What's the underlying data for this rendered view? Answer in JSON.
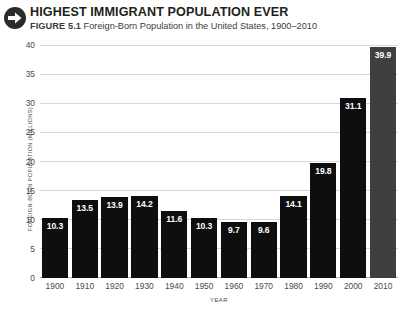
{
  "header": {
    "icon": "arrow-right-circle-icon",
    "title": "HIGHEST IMMIGRANT POPULATION EVER",
    "figure_number": "FIGURE 5.1",
    "figure_caption": "Foreign-Born Population in the United States, 1900–2010"
  },
  "colors": {
    "bar": "#0e0e0e",
    "bar_highlight": "#3f3f3f",
    "gridline": "#d8d8d8",
    "text": "#231f20",
    "axis_text": "#4a4a4a",
    "background": "#ffffff"
  },
  "chart_data": {
    "type": "bar",
    "title": "HIGHEST IMMIGRANT POPULATION EVER",
    "subtitle": "Foreign-Born Population in the United States, 1900–2010",
    "xlabel": "YEAR",
    "ylabel": "FOREIGN-BORN POPULATION (MILLIONS)",
    "categories": [
      "1900",
      "1910",
      "1920",
      "1930",
      "1940",
      "1950",
      "1960",
      "1970",
      "1980",
      "1990",
      "2000",
      "2010"
    ],
    "values": [
      10.3,
      13.5,
      13.9,
      14.2,
      11.6,
      10.3,
      9.7,
      9.6,
      14.1,
      19.8,
      31.1,
      39.9
    ],
    "value_labels": [
      "10.3",
      "13.5",
      "13.9",
      "14.2",
      "11.6",
      "10.3",
      "9.7",
      "9.6",
      "14.1",
      "19.8",
      "31.1",
      "39.9"
    ],
    "ylim": [
      0,
      40
    ],
    "yticks": [
      40,
      35,
      30,
      25,
      20,
      15,
      10,
      5,
      0
    ],
    "ytick_labels": [
      "40",
      "35",
      "30",
      "25",
      "20",
      "15",
      "10",
      "5",
      "0"
    ],
    "grid": true,
    "legend": false,
    "highlight_index": 11
  }
}
